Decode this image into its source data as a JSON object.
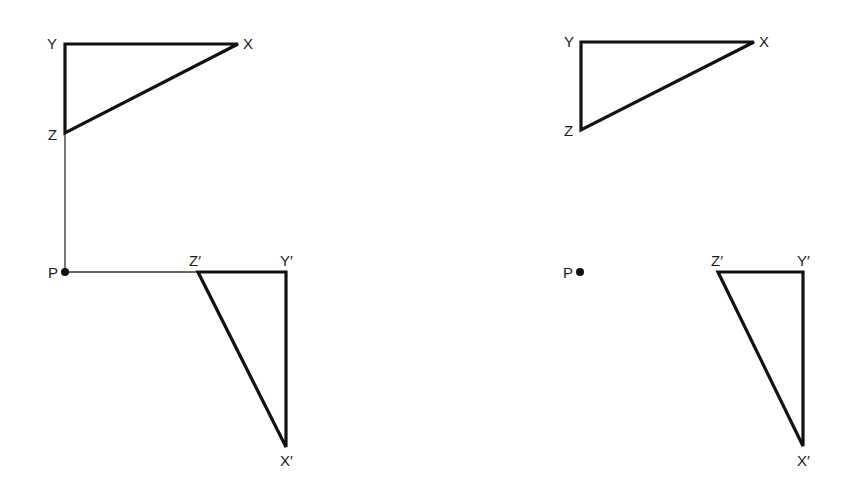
{
  "diagram": {
    "type": "geometric-transformation",
    "colors": {
      "background": "#ffffff",
      "stroke": "#111111",
      "construction": "#333333"
    },
    "panels": [
      {
        "id": "left",
        "has_construction_lines": true,
        "object_triangle": {
          "labels": {
            "X": "X",
            "Y": "Y",
            "Z": "Z"
          },
          "points": {
            "X": [
              238,
              44
            ],
            "Y": [
              65,
              44
            ],
            "Z": [
              65,
              133
            ]
          }
        },
        "image_triangle": {
          "labels": {
            "X": "X′",
            "Y": "Y′",
            "Z": "Z′"
          },
          "points": {
            "X": [
              286,
              447
            ],
            "Y": [
              286,
              272
            ],
            "Z": [
              198,
              272
            ]
          }
        },
        "centre": {
          "label": "P",
          "point": [
            65,
            272
          ]
        }
      },
      {
        "id": "right",
        "has_construction_lines": false,
        "object_triangle": {
          "labels": {
            "X": "X",
            "Y": "Y",
            "Z": "Z"
          },
          "points": {
            "X": [
              754,
              42
            ],
            "Y": [
              581,
              42
            ],
            "Z": [
              581,
              130
            ]
          }
        },
        "image_triangle": {
          "labels": {
            "X": "X′",
            "Y": "Y′",
            "Z": "Z′"
          },
          "points": {
            "X": [
              803,
              446
            ],
            "Y": [
              803,
              272
            ],
            "Z": [
              718,
              272
            ]
          }
        },
        "centre": {
          "label": "P",
          "point": [
            580,
            272
          ]
        }
      }
    ]
  }
}
